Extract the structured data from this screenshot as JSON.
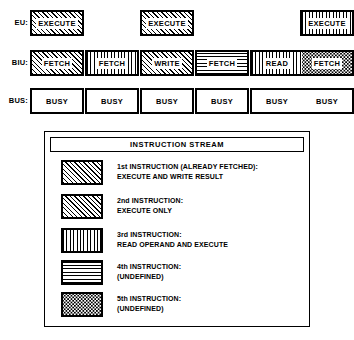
{
  "diagram": {
    "rows": [
      {
        "id": "eu",
        "label": "EU:",
        "slots": [
          {
            "col": 0,
            "label": "EXECUTE",
            "pattern": "diagonal",
            "present": true
          },
          {
            "col": 1,
            "label": "",
            "pattern": "none",
            "present": false
          },
          {
            "col": 2,
            "label": "EXECUTE",
            "pattern": "diagonal",
            "present": true
          },
          {
            "col": 3,
            "label": "",
            "pattern": "none",
            "present": false
          },
          {
            "col": 4,
            "label": "",
            "pattern": "none",
            "present": false
          },
          {
            "col": 5,
            "label": "EXECUTE",
            "pattern": "vertical",
            "present": true
          }
        ]
      },
      {
        "id": "biu",
        "label": "BIU:",
        "slots": [
          {
            "col": 0,
            "label": "FETCH",
            "pattern": "diagonal",
            "present": true
          },
          {
            "col": 1,
            "label": "FETCH",
            "pattern": "vertical",
            "present": true
          },
          {
            "col": 2,
            "label": "WRITE",
            "pattern": "diagonal",
            "present": true
          },
          {
            "col": 3,
            "label": "FETCH",
            "pattern": "horizontal",
            "present": true
          },
          {
            "col": 4,
            "label": "READ",
            "pattern": "vertical",
            "present": true
          },
          {
            "col": 5,
            "label": "FETCH",
            "pattern": "dotted",
            "present": true
          }
        ]
      },
      {
        "id": "bus",
        "label": "BUS:",
        "slots": [
          {
            "col": 0,
            "label": "BUSY",
            "pattern": "none",
            "present": true
          },
          {
            "col": 1,
            "label": "BUSY",
            "pattern": "none",
            "present": true
          },
          {
            "col": 2,
            "label": "BUSY",
            "pattern": "none",
            "present": true
          },
          {
            "col": 3,
            "label": "BUSY",
            "pattern": "none",
            "present": true
          },
          {
            "col": 4,
            "label": "BUSY",
            "pattern": "none",
            "present": true
          },
          {
            "col": 5,
            "label": "BUSY",
            "pattern": "none",
            "present": true
          }
        ]
      }
    ]
  },
  "legend": {
    "title": "INSTRUCTION STREAM",
    "entries": [
      {
        "pattern": "diagonal",
        "line1": "1st INSTRUCTION (ALREADY FETCHED):",
        "line2": "EXECUTE AND WRITE RESULT"
      },
      {
        "pattern": "diagonal",
        "line1": "2nd INSTRUCTION:",
        "line2": "EXECUTE ONLY"
      },
      {
        "pattern": "vertical",
        "line1": "3rd INSTRUCTION:",
        "line2": "READ OPERAND AND EXECUTE"
      },
      {
        "pattern": "horizontal",
        "line1": "4th INSTRUCTION:",
        "line2": "(UNDEFINED)"
      },
      {
        "pattern": "dotted",
        "line1": "5th INSTRUCTION:",
        "line2": "(UNDEFINED)"
      }
    ]
  },
  "colors": {
    "ink": "#000000",
    "paper": "#ffffff"
  }
}
